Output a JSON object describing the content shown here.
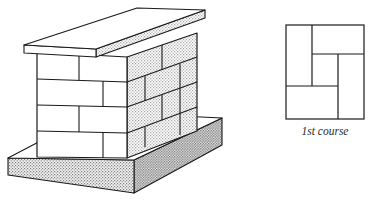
{
  "figure": {
    "background_color": "#ffffff",
    "line_color": "#1a1a1a",
    "hatch_color": "#b9b9b9",
    "face_color": "#ffffff",
    "shaded_face_color": "#d9d9d9",
    "stipple_color": "#9a9a9a"
  },
  "pier": {
    "label": "concrete block pier",
    "cap": {
      "label": "cap slab",
      "fill": "#ffffff",
      "top_face": "24,45 137,8 205,10 96,49",
      "front_face": "24,45 96,49 96,55 24,51",
      "right_face": "96,49 205,10 205,17 96,55"
    },
    "front_face": {
      "label": "front elevation face",
      "fill": "#ffffff",
      "outline": "37,52 127,57 127,158 37,157",
      "course_lines": [
        "37,78 127,80",
        "37,104 127,105",
        "37,131 127,131"
      ],
      "head_joints": [
        "79,52 79,78",
        "103,78 103,104",
        "79,104 79,131",
        "103,131 103,158"
      ]
    },
    "side_face": {
      "label": "shaded return face",
      "fill": "#d9d9d9",
      "outline": "127,57 197,33 197,131 127,158",
      "course_lines": [
        "127,80 197,57",
        "127,105 197,82",
        "127,131 197,107"
      ],
      "head_joints": [
        "162,45 162,70",
        "162,94 162,119",
        "180,70 180,95"
      ]
    }
  },
  "footing": {
    "label": "concrete footing slab",
    "top_face": {
      "fill": "#ffffff",
      "points": "8,175 96,159 222,118 134,160"
    },
    "front_face": {
      "fill": "#e3e3e3",
      "points": "8,175 8,192 134,193 134,160"
    },
    "right_face": {
      "fill": "#cfcfcf",
      "points": "134,160 222,118 222,145 134,193"
    }
  },
  "plan": {
    "label": "first course plan",
    "caption": "1st course",
    "square": {
      "x": 286,
      "y": 25,
      "width": 78,
      "height": 94
    },
    "internal_lines": [
      "286,86 338,86",
      "338,54 364,54",
      "338,54 338,119",
      "312,25 312,86",
      "312,54 364,54"
    ],
    "blocks": [
      {
        "name": "block-upper-left",
        "x": 286,
        "y": 25,
        "w": 26,
        "h": 61
      },
      {
        "name": "block-upper-right",
        "x": 312,
        "y": 25,
        "w": 52,
        "h": 29
      },
      {
        "name": "block-middle",
        "x": 312,
        "y": 54,
        "w": 26,
        "h": 32
      },
      {
        "name": "block-lower-left",
        "x": 286,
        "y": 86,
        "w": 52,
        "h": 33
      },
      {
        "name": "block-right",
        "x": 338,
        "y": 54,
        "w": 26,
        "h": 65
      }
    ]
  }
}
